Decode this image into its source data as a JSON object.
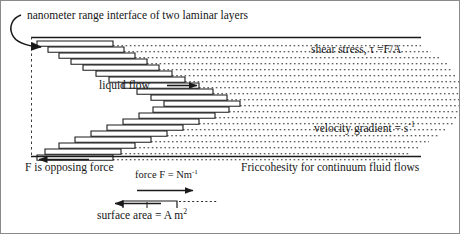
{
  "figure": {
    "title_label": "nanometer range interface of two laminar layers",
    "shear_stress_label": "shear stress, τ =F/A",
    "liquid_flow_label": "liquid flow",
    "velocity_gradient_label": "velocity gradient = s",
    "velocity_gradient_exponent": "-1",
    "opposing_force_label": "F is opposing force",
    "force_label": "force F = Nm",
    "force_exponent": "-1",
    "friccohesity_label": "Friccohesity for continuum fluid flows",
    "surface_area_label": "surface area = A m",
    "surface_area_exponent": "2"
  },
  "colors": {
    "stroke": "#1a1a1a",
    "dotted": "#2b2b2b",
    "background": "#ffffff",
    "border": "#8a8a8a"
  },
  "chart_data": {
    "type": "diagram",
    "title": "nanometer range interface of two laminar layers",
    "layer_count": 20,
    "layers": [
      {
        "index": 0,
        "x": 36,
        "y": 40,
        "width": 76,
        "dotted_to": 420
      },
      {
        "index": 1,
        "x": 47,
        "y": 46,
        "width": 76,
        "dotted_to": 430
      },
      {
        "index": 2,
        "x": 58,
        "y": 52,
        "width": 76,
        "dotted_to": 440
      },
      {
        "index": 3,
        "x": 70,
        "y": 58,
        "width": 76,
        "dotted_to": 446
      },
      {
        "index": 4,
        "x": 82,
        "y": 64,
        "width": 76,
        "dotted_to": 452
      },
      {
        "index": 5,
        "x": 95,
        "y": 70,
        "width": 76,
        "dotted_to": 456
      },
      {
        "index": 6,
        "x": 108,
        "y": 76,
        "width": 76,
        "dotted_to": 458
      },
      {
        "index": 7,
        "x": 122,
        "y": 82,
        "width": 76,
        "dotted_to": 458
      },
      {
        "index": 8,
        "x": 136,
        "y": 88,
        "width": 76,
        "dotted_to": 458
      },
      {
        "index": 9,
        "x": 150,
        "y": 94,
        "width": 76,
        "dotted_to": 458
      },
      {
        "index": 10,
        "x": 163,
        "y": 100,
        "width": 76,
        "dotted_to": 458
      },
      {
        "index": 11,
        "x": 152,
        "y": 106,
        "width": 76,
        "dotted_to": 458
      },
      {
        "index": 12,
        "x": 138,
        "y": 112,
        "width": 76,
        "dotted_to": 456
      },
      {
        "index": 13,
        "x": 122,
        "y": 118,
        "width": 76,
        "dotted_to": 452
      },
      {
        "index": 14,
        "x": 106,
        "y": 124,
        "width": 76,
        "dotted_to": 446
      },
      {
        "index": 15,
        "x": 90,
        "y": 130,
        "width": 76,
        "dotted_to": 438
      },
      {
        "index": 16,
        "x": 74,
        "y": 136,
        "width": 76,
        "dotted_to": 428
      },
      {
        "index": 17,
        "x": 58,
        "y": 142,
        "width": 76,
        "dotted_to": 418
      },
      {
        "index": 18,
        "x": 44,
        "y": 148,
        "width": 76,
        "dotted_to": 408
      },
      {
        "index": 19,
        "x": 36,
        "y": 154,
        "width": 76,
        "dotted_to": 398
      }
    ],
    "annotations": [
      {
        "name": "shear-stress",
        "text": "shear stress, τ =F/A",
        "x": 310,
        "y": 50
      },
      {
        "name": "liquid-flow",
        "text": "liquid flow",
        "x": 98,
        "y": 86
      },
      {
        "name": "velocity-gradient",
        "text": "velocity gradient = s-1",
        "x": 313,
        "y": 129
      },
      {
        "name": "opposing-force",
        "text": "F is opposing force",
        "x": 24,
        "y": 168
      },
      {
        "name": "force",
        "text": "force F = Nm-1",
        "x": 134,
        "y": 176
      },
      {
        "name": "friccohesity",
        "text": "Friccohesity for continuum fluid flows",
        "x": 240,
        "y": 168
      },
      {
        "name": "surface-area",
        "text": "surface area = A m2",
        "x": 96,
        "y": 216
      }
    ],
    "arrows": [
      {
        "name": "interface-hook-arrow",
        "direction": "curved-right",
        "x": 18,
        "y": 20
      },
      {
        "name": "liquid-flow-arrow",
        "direction": "right",
        "x": 168,
        "y": 84
      },
      {
        "name": "opposing-force-arrow",
        "direction": "left",
        "x": 36,
        "y": 158
      },
      {
        "name": "force-direction-arrow",
        "direction": "right",
        "x": 136,
        "y": 189
      },
      {
        "name": "surface-area-arrow",
        "direction": "left",
        "x": 112,
        "y": 203
      }
    ],
    "guide_line": {
      "name": "interface-datum",
      "x": 30,
      "y_top": 36,
      "y_bottom": 160,
      "style": "dashed"
    }
  }
}
